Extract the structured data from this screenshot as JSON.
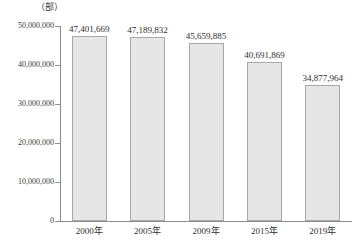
{
  "chart_data": {
    "type": "bar",
    "title": "",
    "subtitle": "",
    "unit_label": "（部）",
    "xlabel": "",
    "ylabel": "",
    "categories": [
      "2000年",
      "2005年",
      "2009年",
      "2015年",
      "2019年"
    ],
    "values": [
      47401669,
      47189832,
      45659885,
      40691869,
      34877964
    ],
    "value_labels": [
      "47,401,669",
      "47,189,832",
      "45,659,885",
      "40,691,869",
      "34,877,964"
    ],
    "ylim": [
      0,
      50000000
    ],
    "ytick_values": [
      50000000,
      40000000,
      30000000,
      20000000,
      10000000,
      0
    ],
    "ytick_labels": [
      "50,000,000",
      "40,000,000",
      "30,000,000",
      "20,000,000",
      "10,000,000",
      "0"
    ],
    "grid": false,
    "legend": null,
    "legend_position": "none",
    "bar_fill_color": "#e6e6e6",
    "bar_border_color": "#a8a8a8",
    "axis_color": "#8c8c8c",
    "text_color": "#2e2e2e",
    "background_color": "#ffffff"
  }
}
